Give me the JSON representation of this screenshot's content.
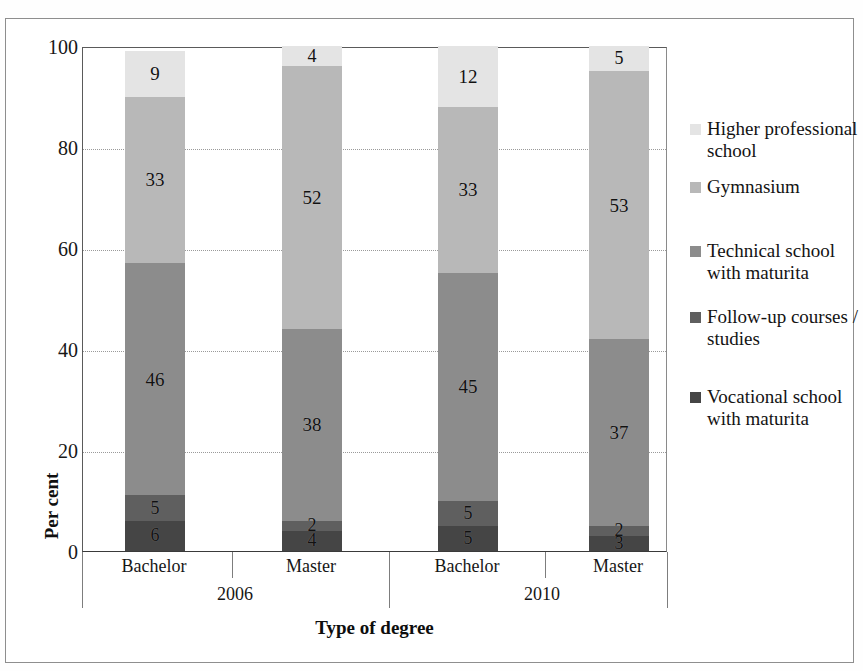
{
  "figure": {
    "background_color": "#ffffff",
    "frame_color": "#8e8e8e",
    "cropped_title_ghost": ""
  },
  "chart_data": {
    "type": "bar",
    "subtype": "stacked-100-percent",
    "title": "",
    "xlabel": "Type of degree",
    "ylabel": "Per cent",
    "ylim": [
      0,
      100
    ],
    "ytick_step": 20,
    "yticks": [
      "0",
      "20",
      "40",
      "60",
      "80",
      "100"
    ],
    "grid": true,
    "grid_style": "dotted",
    "legend_position": "right",
    "categories": [
      "Bachelor",
      "Master",
      "Bachelor",
      "Master"
    ],
    "group_labels": [
      "2006",
      "2010"
    ],
    "groups": [
      {
        "label": "2006",
        "categories": [
          "Bachelor",
          "Master"
        ]
      },
      {
        "label": "2010",
        "categories": [
          "Bachelor",
          "Master"
        ]
      }
    ],
    "series": [
      {
        "name": "Vocational school with maturita",
        "color": "#454545",
        "values": [
          6,
          4,
          5,
          3
        ]
      },
      {
        "name": "Follow-up courses / studies",
        "color": "#5f5f5f",
        "values": [
          5,
          2,
          5,
          2
        ]
      },
      {
        "name": "Technical school with maturita",
        "color": "#8c8c8c",
        "values": [
          46,
          38,
          45,
          37
        ]
      },
      {
        "name": "Gymnasium",
        "color": "#b8b8b8",
        "values": [
          33,
          52,
          33,
          53
        ]
      },
      {
        "name": "Higher professional school",
        "color": "#e4e4e4",
        "values": [
          9,
          4,
          12,
          5
        ]
      }
    ],
    "bar_totals": [
      99,
      100,
      100,
      100
    ]
  },
  "legend": {
    "items": [
      {
        "label": "Higher professional school",
        "color": "#e4e4e4"
      },
      {
        "label": "Gymnasium",
        "color": "#b8b8b8"
      },
      {
        "label": "Technical school with maturita",
        "color": "#8c8c8c"
      },
      {
        "label": "Follow-up courses / studies",
        "color": "#5f5f5f"
      },
      {
        "label": "Vocational school with maturita",
        "color": "#454545"
      }
    ]
  }
}
